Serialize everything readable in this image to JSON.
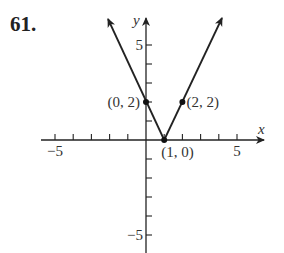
{
  "problem_number": "61.",
  "chart_data": {
    "type": "line",
    "title": "",
    "function": "y = 2|x - 1|",
    "xlabel": "x",
    "ylabel": "y",
    "xlim": [
      -6,
      6
    ],
    "ylim": [
      -6,
      6
    ],
    "grid": false,
    "x_tick_labels": [
      {
        "value": -5,
        "label": "−5"
      },
      {
        "value": 5,
        "label": "5"
      }
    ],
    "y_tick_labels": [
      {
        "value": 5,
        "label": "5"
      },
      {
        "value": -5,
        "label": "−5"
      }
    ],
    "series": [
      {
        "name": "y = 2|x − 1|",
        "x": [
          -2.1,
          0,
          1,
          2,
          4.1
        ],
        "y": [
          6.4,
          2,
          0,
          2,
          6.4
        ]
      }
    ],
    "annotations": [
      {
        "point": [
          0,
          2
        ],
        "label": "(0, 2)"
      },
      {
        "point": [
          1,
          0
        ],
        "label": "(1, 0)"
      },
      {
        "point": [
          2,
          2
        ],
        "label": "(2, 2)"
      }
    ]
  }
}
